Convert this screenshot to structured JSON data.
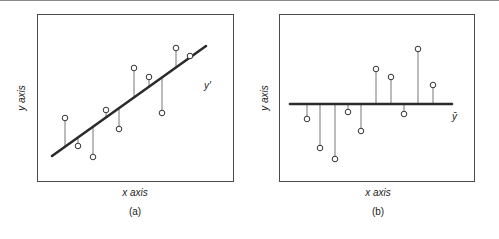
{
  "panels": [
    {
      "id": "a",
      "caption": "(a)",
      "xlabel": "x axis",
      "ylabel": "y axis",
      "line_label": "y′",
      "line_type": "regression"
    },
    {
      "id": "b",
      "caption": "(b)",
      "xlabel": "x axis",
      "ylabel": "y axis",
      "line_label": "ȳ",
      "line_type": "mean"
    }
  ],
  "chart_data": [
    {
      "type": "scatter",
      "title": "(a)",
      "xlabel": "x axis",
      "ylabel": "y axis",
      "description": "Data points with vertical residual segments to the fitted regression line y′",
      "fit_line": {
        "label": "y′",
        "x1": 52,
        "y1": 156,
        "x2": 206,
        "y2": 46
      },
      "points": [
        {
          "x": 65,
          "y": 118
        },
        {
          "x": 78,
          "y": 146
        },
        {
          "x": 93,
          "y": 157
        },
        {
          "x": 106,
          "y": 110
        },
        {
          "x": 119,
          "y": 129
        },
        {
          "x": 134,
          "y": 68
        },
        {
          "x": 149,
          "y": 77
        },
        {
          "x": 162,
          "y": 113
        },
        {
          "x": 176,
          "y": 48
        },
        {
          "x": 190,
          "y": 56
        }
      ],
      "grid": false
    },
    {
      "type": "scatter",
      "title": "(b)",
      "xlabel": "x axis",
      "ylabel": "y axis",
      "description": "Same data points with vertical deviations to the horizontal mean line ȳ",
      "mean_line": {
        "label": "ȳ",
        "x1": 290,
        "x2": 452,
        "y": 104
      },
      "points": [
        {
          "x": 307,
          "y": 119
        },
        {
          "x": 320,
          "y": 148
        },
        {
          "x": 335,
          "y": 159
        },
        {
          "x": 348,
          "y": 112
        },
        {
          "x": 361,
          "y": 131
        },
        {
          "x": 376,
          "y": 69
        },
        {
          "x": 391,
          "y": 77
        },
        {
          "x": 404,
          "y": 114
        },
        {
          "x": 418,
          "y": 49
        },
        {
          "x": 433,
          "y": 85
        }
      ],
      "grid": false
    }
  ]
}
